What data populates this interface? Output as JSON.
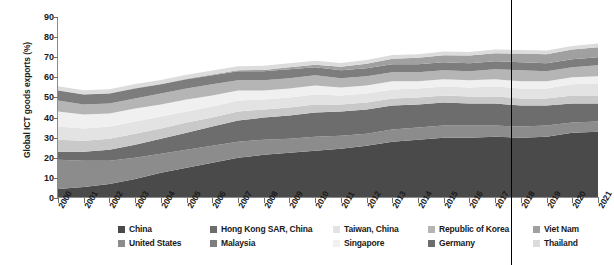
{
  "chart": {
    "type": "area",
    "title": "",
    "ylabel": "Global ICT goods exports (%)",
    "xlabel": ""
  },
  "chart_data": {
    "type": "area",
    "stacked": true,
    "title": "",
    "xlabel": "",
    "ylabel": "Global ICT goods exports (%)",
    "ylim": [
      0,
      90
    ],
    "ytick_step": 10,
    "yticks": [
      0,
      10,
      20,
      30,
      40,
      50,
      60,
      70,
      80,
      90
    ],
    "grid": false,
    "legend_position": "bottom",
    "x": [
      2000,
      2001,
      2002,
      2003,
      2004,
      2005,
      2006,
      2007,
      2008,
      2009,
      2010,
      2011,
      2012,
      2013,
      2014,
      2015,
      2016,
      2017,
      2018,
      2019,
      2020,
      2021
    ],
    "annotations": [
      {
        "name": "vertical-reference-line",
        "type": "vline",
        "x": 2017.6,
        "color": "#000000"
      }
    ],
    "series": [
      {
        "name": "China",
        "color": "#4a4a4a",
        "values": [
          4.5,
          5.5,
          7.0,
          9.5,
          12.5,
          15.0,
          17.5,
          20.0,
          21.5,
          22.5,
          23.5,
          24.5,
          26.0,
          28.0,
          29.0,
          30.0,
          30.0,
          30.5,
          30.0,
          30.5,
          32.5,
          33.0
        ]
      },
      {
        "name": "United States",
        "color": "#8c8c8c",
        "values": [
          14.5,
          13.0,
          11.5,
          10.5,
          9.5,
          9.0,
          8.5,
          8.0,
          7.5,
          7.0,
          7.0,
          6.5,
          6.0,
          6.0,
          6.0,
          6.0,
          6.0,
          5.5,
          5.5,
          5.5,
          5.0,
          5.0
        ]
      },
      {
        "name": "Hong Kong SAR, China",
        "color": "#6d6d6d",
        "values": [
          4.0,
          4.5,
          5.5,
          6.5,
          7.5,
          8.5,
          9.5,
          10.5,
          11.0,
          11.5,
          12.0,
          12.0,
          12.0,
          12.0,
          11.5,
          11.5,
          11.0,
          11.0,
          10.5,
          10.0,
          9.5,
          9.0
        ]
      },
      {
        "name": "Malaysia",
        "color": "#c9c9c9",
        "values": [
          6.0,
          5.5,
          5.5,
          5.5,
          5.0,
          5.0,
          4.5,
          4.5,
          4.0,
          4.0,
          4.0,
          3.5,
          3.5,
          3.5,
          3.5,
          3.5,
          3.5,
          3.5,
          3.5,
          3.5,
          4.0,
          4.0
        ]
      },
      {
        "name": "Taiwan, China",
        "color": "#e3e3e3",
        "values": [
          6.5,
          6.0,
          6.0,
          6.0,
          6.0,
          5.5,
          5.5,
          5.5,
          5.0,
          5.0,
          5.0,
          4.5,
          4.5,
          4.5,
          4.5,
          4.5,
          4.5,
          5.0,
          5.0,
          5.0,
          5.5,
          6.0
        ]
      },
      {
        "name": "Singapore",
        "color": "#f0f0f0",
        "values": [
          7.5,
          7.0,
          6.5,
          6.5,
          6.0,
          6.0,
          5.5,
          5.0,
          4.5,
          4.5,
          4.5,
          4.0,
          4.0,
          4.0,
          3.5,
          3.5,
          3.5,
          3.5,
          3.5,
          3.5,
          3.5,
          3.5
        ]
      },
      {
        "name": "Republic of Korea",
        "color": "#b5b5b5",
        "values": [
          5.5,
          5.0,
          5.0,
          5.0,
          5.5,
          5.5,
          5.5,
          5.0,
          5.0,
          5.0,
          5.0,
          4.5,
          4.5,
          4.5,
          4.5,
          4.5,
          4.5,
          5.0,
          5.5,
          5.0,
          5.0,
          5.5
        ]
      },
      {
        "name": "Germany",
        "color": "#7d7d7d",
        "values": [
          5.0,
          5.0,
          5.0,
          5.0,
          4.5,
          4.5,
          4.5,
          4.5,
          4.5,
          4.5,
          4.0,
          4.0,
          4.0,
          4.0,
          4.0,
          4.0,
          4.0,
          4.0,
          4.0,
          4.0,
          4.0,
          4.0
        ]
      },
      {
        "name": "Viet Nam",
        "color": "#a0a0a0",
        "values": [
          0.1,
          0.1,
          0.1,
          0.2,
          0.2,
          0.3,
          0.4,
          0.5,
          0.7,
          1.0,
          1.3,
          1.8,
          2.3,
          2.8,
          3.2,
          3.5,
          3.8,
          4.0,
          4.3,
          4.5,
          4.8,
          5.0
        ]
      },
      {
        "name": "Thailand",
        "color": "#dcdcdc",
        "values": [
          2.0,
          2.0,
          2.0,
          2.0,
          2.0,
          2.0,
          2.0,
          2.0,
          2.0,
          2.0,
          2.0,
          1.8,
          1.8,
          1.8,
          1.8,
          1.8,
          1.8,
          1.8,
          1.8,
          1.8,
          1.8,
          1.8
        ]
      }
    ]
  },
  "legend": {
    "rows": [
      [
        {
          "label": "China",
          "color": "#4a4a4a"
        },
        {
          "label": "Hong Kong SAR, China",
          "color": "#6d6d6d"
        },
        {
          "label": "Taiwan, China",
          "color": "#e3e3e3"
        },
        {
          "label": "Republic of Korea",
          "color": "#b5b5b5"
        },
        {
          "label": "Viet Nam",
          "color": "#a0a0a0"
        }
      ],
      [
        {
          "label": "United States",
          "color": "#8c8c8c"
        },
        {
          "label": "Malaysia",
          "color": "#7d7d7d"
        },
        {
          "label": "Singapore",
          "color": "#f0f0f0"
        },
        {
          "label": "Germany",
          "color": "#6d6d6d"
        },
        {
          "label": "Thailand",
          "color": "#dcdcdc"
        }
      ]
    ]
  }
}
